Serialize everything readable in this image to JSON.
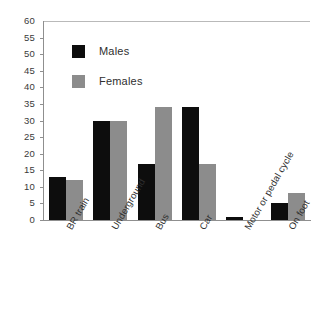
{
  "chart_data": {
    "type": "bar",
    "title": "",
    "subtitle": "",
    "xlabel": "",
    "ylabel": "",
    "ylim": [
      0,
      60
    ],
    "ytick_step": 5,
    "yticks": [
      0,
      5,
      10,
      15,
      20,
      25,
      30,
      35,
      40,
      45,
      50,
      55,
      60
    ],
    "grid": false,
    "legend_position": "top-left-inside",
    "categories": [
      "BR train",
      "Underground",
      "Bus",
      "Car",
      "Motor or pedal cycle",
      "On foot"
    ],
    "series": [
      {
        "name": "Males",
        "color": "#0d0d0d",
        "values": [
          13,
          30,
          17,
          34,
          1,
          5
        ]
      },
      {
        "name": "Females",
        "color": "#8c8c8c",
        "values": [
          12,
          30,
          34,
          17,
          0,
          8
        ]
      }
    ]
  },
  "legend": {
    "items": [
      {
        "label": "Males",
        "swatch": "male"
      },
      {
        "label": "Females",
        "swatch": "female"
      }
    ]
  },
  "colors": {
    "males": "#0d0d0d",
    "females": "#8c8c8c",
    "axis": "#8f8f8f",
    "background": "#ffffff",
    "tick_text": "#3a3a3a"
  }
}
